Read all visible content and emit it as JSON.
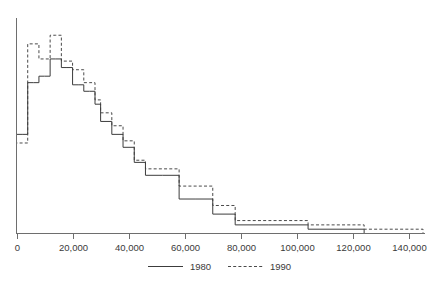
{
  "chart_data": {
    "type": "line",
    "subtype": "step-histogram",
    "title": "",
    "subtitle": "",
    "xlabel": "",
    "ylabel": "",
    "xlim": [
      0,
      145000
    ],
    "ylim": [
      0,
      100
    ],
    "grid": false,
    "legend_position": "bottom-center",
    "xticks": [
      0,
      20000,
      40000,
      60000,
      80000,
      100000,
      120000,
      140000
    ],
    "xtick_labels": [
      "0",
      "20,000",
      "40,000",
      "60,000",
      "80,000",
      "100,000",
      "120,000",
      "140,000"
    ],
    "yticks": [],
    "ytick_labels": [],
    "bin_edges": [
      0,
      2000,
      4000,
      6000,
      8000,
      10000,
      12000,
      14000,
      16000,
      18000,
      20000,
      22000,
      24000,
      26000,
      28000,
      30000,
      34000,
      38000,
      42000,
      46000,
      52000,
      58000,
      64000,
      70000,
      78000,
      90000,
      104000,
      124000,
      145000
    ],
    "series": [
      {
        "name": "1980",
        "style": "solid",
        "color": "#3c3c3c",
        "values": [
          46,
          46,
          70,
          70,
          73,
          73,
          81,
          81,
          77,
          77,
          69,
          69,
          66,
          66,
          60,
          52,
          46,
          40,
          33,
          27,
          27,
          16,
          16,
          9,
          4,
          4,
          2,
          0
        ]
      },
      {
        "name": "1990",
        "style": "dashed",
        "color": "#4a4a4a",
        "values": [
          42,
          42,
          88,
          88,
          81,
          81,
          92,
          92,
          80,
          80,
          76,
          76,
          70,
          70,
          62,
          56,
          50,
          43,
          34,
          30,
          30,
          22,
          22,
          13,
          6,
          6,
          4,
          2
        ]
      }
    ]
  },
  "legend": {
    "entries": [
      {
        "label": "1980",
        "style": "solid"
      },
      {
        "label": "1990",
        "style": "dashed"
      }
    ]
  }
}
